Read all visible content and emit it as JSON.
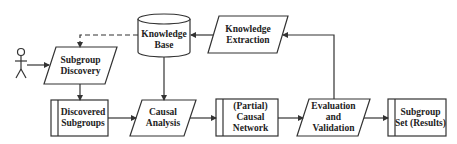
{
  "diagram": {
    "type": "flowchart",
    "nodes": [
      {
        "id": "actor",
        "shape": "stick-figure",
        "label": ""
      },
      {
        "id": "subgroup_discovery",
        "shape": "parallelogram",
        "label": "Subgroup\nDiscovery"
      },
      {
        "id": "knowledge_base",
        "shape": "cylinder",
        "label": "Knowledge\nBase"
      },
      {
        "id": "knowledge_extraction",
        "shape": "parallelogram",
        "label": "Knowledge\nExtraction"
      },
      {
        "id": "discovered_subgroups",
        "shape": "predefined-process",
        "label": "Discovered\nSubgroups"
      },
      {
        "id": "causal_analysis",
        "shape": "parallelogram",
        "label": "Causal\nAnalysis"
      },
      {
        "id": "partial_causal_network",
        "shape": "predefined-process",
        "label": "(Partial)\nCausal\nNetwork"
      },
      {
        "id": "evaluation_validation",
        "shape": "parallelogram",
        "label": "Evaluation\nand\nValidation"
      },
      {
        "id": "subgroup_set",
        "shape": "predefined-process",
        "label": "Subgroup\nSet (Results)"
      }
    ],
    "edges": [
      {
        "from": "actor",
        "to": "subgroup_discovery",
        "style": "solid"
      },
      {
        "from": "knowledge_base",
        "to": "subgroup_discovery",
        "style": "dashed"
      },
      {
        "from": "knowledge_extraction",
        "to": "knowledge_base",
        "style": "solid"
      },
      {
        "from": "subgroup_discovery",
        "to": "discovered_subgroups",
        "style": "solid"
      },
      {
        "from": "knowledge_base",
        "to": "causal_analysis",
        "style": "solid"
      },
      {
        "from": "discovered_subgroups",
        "to": "causal_analysis",
        "style": "solid"
      },
      {
        "from": "causal_analysis",
        "to": "partial_causal_network",
        "style": "solid"
      },
      {
        "from": "partial_causal_network",
        "to": "evaluation_validation",
        "style": "solid"
      },
      {
        "from": "evaluation_validation",
        "to": "knowledge_extraction",
        "style": "solid"
      },
      {
        "from": "evaluation_validation",
        "to": "subgroup_set",
        "style": "solid"
      }
    ]
  },
  "colors": {
    "stroke": "#333333",
    "background": "#ffffff"
  }
}
